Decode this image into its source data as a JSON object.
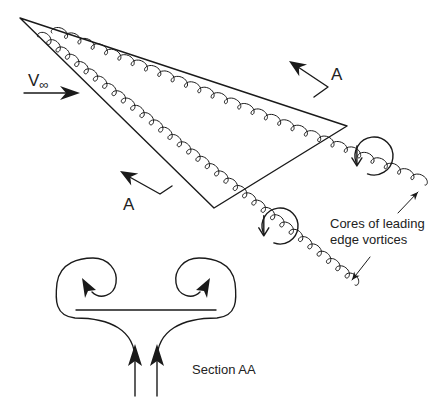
{
  "diagram": {
    "colors": {
      "ink": "#1a1a1a",
      "text": "#222222",
      "background": "#ffffff"
    },
    "wing": {
      "apex": [
        20,
        18
      ],
      "tip": [
        347,
        126
      ],
      "trailing_root": [
        214,
        208
      ]
    },
    "freestream": {
      "label_main": "V",
      "label_sub": "∞",
      "label_pos": [
        28,
        86
      ],
      "arrow_from": [
        24,
        93
      ],
      "arrow_to": [
        80,
        93
      ]
    },
    "section_markers": [
      {
        "label": "A",
        "label_pos": [
          331,
          80
        ],
        "head": [
          289,
          61
        ],
        "bend": [
          328,
          87
        ],
        "tail": [
          314,
          97
        ]
      },
      {
        "label": "A",
        "label_pos": [
          123,
          210
        ],
        "head": [
          120,
          171
        ],
        "bend": [
          160,
          194
        ],
        "tail": [
          172,
          186
        ]
      }
    ],
    "vortex_cores": [
      {
        "name": "upper",
        "start": [
          52,
          33
        ],
        "end": [
          425,
          185
        ],
        "loops": 28,
        "amp": 4
      },
      {
        "name": "lower",
        "start": [
          38,
          37
        ],
        "end": [
          355,
          285
        ],
        "loops": 34,
        "amp": 4
      }
    ],
    "rotation_indicators": [
      {
        "center": [
          374,
          156
        ],
        "r": 19
      },
      {
        "center": [
          280,
          226
        ],
        "r": 18
      }
    ],
    "callout": {
      "line1": "Cores of leading",
      "line2": "edge vortices",
      "pos": [
        330,
        228
      ],
      "pointer_upper": {
        "from": [
          398,
          213
        ],
        "to": [
          418,
          192
        ]
      },
      "pointer_lower": {
        "from": [
          370,
          257
        ],
        "to": [
          352,
          280
        ]
      }
    },
    "section_view": {
      "label": "Section AA",
      "label_pos": [
        192,
        374
      ],
      "wing_line": {
        "from": [
          76,
          310
        ],
        "to": [
          216,
          310
        ]
      },
      "inflow_arrows": [
        {
          "x": 135,
          "y_bottom": 396,
          "y_head": 354
        },
        {
          "x": 157,
          "y_bottom": 396,
          "y_head": 354
        }
      ]
    }
  }
}
